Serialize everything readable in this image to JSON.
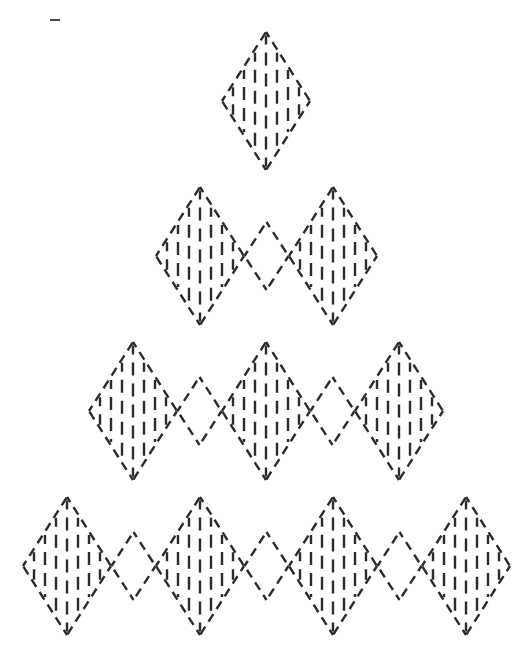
{
  "figure": {
    "width": 531,
    "height": 666,
    "background_color": "#ffffff",
    "stroke_color": "#2b2b2b",
    "stroke_width": 2.4,
    "dash_pattern": "9 6"
  },
  "geometry": {
    "diamond_half_width": 44,
    "diamond_half_height": 69,
    "small_diamond_half_width": 22,
    "small_diamond_half_height": 34,
    "center_x": 266,
    "row_pitch_y": 155,
    "column_pitch_x": 133,
    "first_row_center_y": 101,
    "hatch_spacing": 11,
    "hatch_dash_pattern": "13 8"
  },
  "rows": [
    {
      "index": 1,
      "label": "row-1",
      "filled_count": 1,
      "open_count": 0,
      "center_y": 101,
      "centers_x": [
        266
      ]
    },
    {
      "index": 2,
      "label": "row-2",
      "filled_count": 2,
      "open_count": 1,
      "center_y": 256,
      "centers_x": [
        200,
        333
      ]
    },
    {
      "index": 3,
      "label": "row-3",
      "filled_count": 3,
      "open_count": 2,
      "center_y": 411,
      "centers_x": [
        133,
        266,
        399
      ]
    },
    {
      "index": 4,
      "label": "row-4",
      "filled_count": 4,
      "open_count": 3,
      "center_y": 566,
      "centers_x": [
        67,
        200,
        333,
        466
      ]
    }
  ],
  "marks": [
    {
      "name": "stray-dash",
      "x": 50,
      "y": 19,
      "width": 10,
      "height": 2,
      "color": "#4a4a4a"
    }
  ],
  "legend": {
    "filled_diamond_name": "hatched-diamond",
    "open_diamond_name": "open-diamond"
  }
}
